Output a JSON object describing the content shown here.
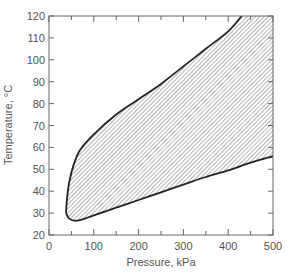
{
  "chart_data": {
    "type": "area",
    "title": "",
    "xlabel": "Pressure, kPa",
    "ylabel": "Temperature, °C",
    "xlim": [
      0,
      500
    ],
    "ylim": [
      20,
      120
    ],
    "x_ticks": [
      0,
      100,
      200,
      300,
      400,
      500
    ],
    "y_ticks": [
      20,
      30,
      40,
      50,
      60,
      70,
      80,
      90,
      100,
      110,
      120
    ],
    "x_minor_ticks": [
      50,
      150,
      250,
      350,
      450
    ],
    "grid": false,
    "legend": null,
    "fill": "diagonal hatch",
    "series": [
      {
        "name": "upper boundary",
        "x": [
          38,
          40,
          45,
          55,
          70,
          100,
          150,
          200,
          250,
          300,
          350,
          400,
          430
        ],
        "y": [
          30,
          36,
          44,
          52,
          59,
          66,
          75,
          82,
          89,
          97,
          105,
          113,
          120
        ]
      },
      {
        "name": "lower boundary",
        "x": [
          38,
          45,
          60,
          80,
          100,
          150,
          200,
          250,
          300,
          350,
          400,
          450,
          500
        ],
        "y": [
          30,
          27.5,
          26.5,
          27.5,
          29,
          32.5,
          36,
          39.5,
          43,
          46.5,
          49.5,
          53,
          56
        ]
      }
    ]
  },
  "axes": {
    "xlabel": "Pressure, kPa",
    "ylabel": "Temperature, °C",
    "x_tick_labels": [
      "0",
      "100",
      "200",
      "300",
      "400",
      "500"
    ],
    "y_tick_labels": [
      "20",
      "30",
      "40",
      "50",
      "60",
      "70",
      "80",
      "90",
      "100",
      "110",
      "120"
    ]
  }
}
